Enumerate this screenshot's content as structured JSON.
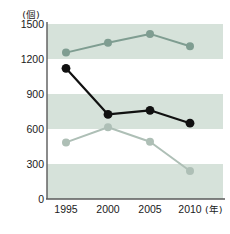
{
  "chart_data": {
    "type": "line",
    "title": "",
    "subtitle": "",
    "xlabel": "(年)",
    "ylabel": "(個)",
    "categories": [
      "1995",
      "2000",
      "2005",
      "2010"
    ],
    "x": [
      1995,
      2000,
      2005,
      2010
    ],
    "ylim": [
      0,
      1500
    ],
    "yticks": [
      0,
      300,
      600,
      900,
      1200,
      1500
    ],
    "ytick_labels": [
      "0",
      "300",
      "600",
      "900",
      "1200",
      "1500"
    ],
    "grid": "horizontal-bands",
    "legend": "none",
    "series": [
      {
        "name": "series-1",
        "color": "#7f9d91",
        "values": [
          1255,
          1340,
          1415,
          1310
        ]
      },
      {
        "name": "series-2",
        "color": "#111111",
        "values": [
          1120,
          725,
          760,
          650
        ]
      },
      {
        "name": "series-3",
        "color": "#aebfb6",
        "values": [
          485,
          615,
          490,
          240
        ]
      }
    ]
  },
  "axes": {
    "y_unit": "(個)",
    "x_unit": "(年)",
    "y_ticks": [
      "1500",
      "1200",
      "900",
      "600",
      "300",
      "0"
    ],
    "x_ticks": [
      "1995",
      "2000",
      "2005",
      "2010"
    ]
  },
  "colors": {
    "band": "#d6e2da",
    "axis": "#5a5a5a",
    "text": "#1a1a1a",
    "series_1": "#7f9d91",
    "series_2": "#111111",
    "series_3": "#aebfb6",
    "background": "#ffffff"
  }
}
